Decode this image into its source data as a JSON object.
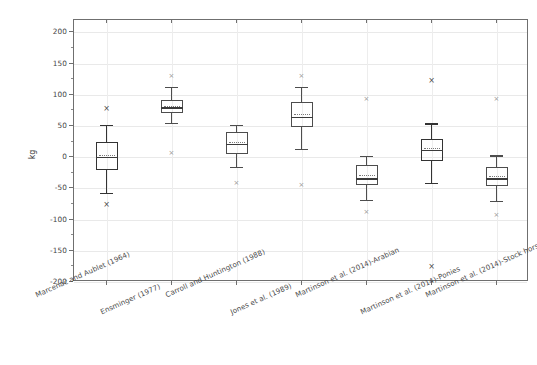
{
  "chart_data": {
    "type": "box",
    "title": "",
    "xlabel": "",
    "ylabel": "kg",
    "ylim": [
      -200,
      220
    ],
    "yticks": [
      200,
      150,
      100,
      50,
      0,
      -50,
      -100,
      -150,
      -200
    ],
    "ytick_labels": [
      "200",
      "150",
      "100",
      "50",
      "0",
      "-50",
      "-100",
      "-150",
      "-200"
    ],
    "grid": true,
    "legend": "none",
    "categories": [
      "Marcenac and Aublet (1964)",
      "Ensminger (1977)",
      "Carroll and Huntington (1988)",
      "Jones et al. (1989)",
      "Martinson et al. (2014)-Arabian",
      "Martinson et al. (2014)-Ponies",
      "Martinson et al. (2014)-Stock horses"
    ],
    "boxes": [
      {
        "category": "Marcenac and Aublet (1964)",
        "whisker_low": -57,
        "q1": -21,
        "median": 1,
        "mean": 3,
        "q3": 24,
        "whisker_high": 52,
        "outliers": [
          79,
          -75
        ],
        "emphasis": "bold"
      },
      {
        "category": "Ensminger (1977)",
        "whisker_low": 55,
        "q1": 71,
        "median": 80,
        "mean": 82,
        "q3": 91,
        "whisker_high": 113,
        "outliers": [
          131,
          7
        ],
        "emphasis": "normal"
      },
      {
        "category": "Carroll and Huntington (1988)",
        "whisker_low": -16,
        "q1": 5,
        "median": 21,
        "mean": 25,
        "q3": 40,
        "whisker_high": 52,
        "outliers": [
          -42
        ],
        "emphasis": "normal"
      },
      {
        "category": "Jones et al. (1989)",
        "whisker_low": 13,
        "q1": 49,
        "median": 65,
        "mean": 69,
        "q3": 88,
        "whisker_high": 113,
        "outliers": [
          131,
          -44
        ],
        "emphasis": "normal"
      },
      {
        "category": "Martinson et al. (2014)-Arabian",
        "whisker_low": -68,
        "q1": -44,
        "median": -34,
        "mean": -29,
        "q3": -13,
        "whisker_high": 2,
        "outliers": [
          93,
          -88
        ],
        "emphasis": "normal"
      },
      {
        "category": "Martinson et al. (2014)-Ponies",
        "whisker_low": -41,
        "q1": -6,
        "median": 12,
        "mean": 15,
        "q3": 30,
        "whisker_high": 55,
        "outliers": [
          124,
          -174
        ],
        "emphasis": "bold"
      },
      {
        "category": "Martinson et al. (2014)-Stock horses",
        "whisker_low": -70,
        "q1": -46,
        "median": -34,
        "mean": -30,
        "q3": -15,
        "whisker_high": 3,
        "outliers": [
          93,
          -92
        ],
        "emphasis": "normal"
      }
    ],
    "colors": {
      "frame": "#6f6f6f",
      "grid": "#e9e9e9",
      "box": "#4d4d4d",
      "box_bold": "#333333",
      "outlier": "#9a9a9a",
      "text": "#444444"
    }
  }
}
